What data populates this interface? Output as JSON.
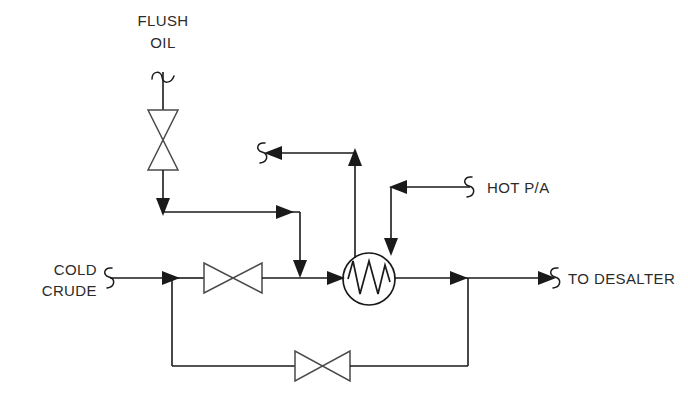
{
  "diagram": {
    "type": "process-flow-diagram",
    "background_color": "#ffffff",
    "line_color": "#1a1a1a",
    "valve_color": "#4a4a4a",
    "text_color": "#2b2b2b",
    "labels": {
      "flush_oil_line1": "FLUSH",
      "flush_oil_line2": "OIL",
      "cold_crude_line1": "COLD",
      "cold_crude_line2": "CRUDE",
      "hot_pa": "HOT P/A",
      "to_desalter": "TO DESALTER"
    },
    "equipment": [
      {
        "name": "heat-exchanger",
        "symbol": "circle-with-zigzag-coil",
        "cx": 369,
        "cy": 279,
        "r": 26
      },
      {
        "name": "flush-oil-valve",
        "symbol": "bowtie-gate-valve",
        "orientation": "vertical",
        "cx": 163,
        "cy": 140
      },
      {
        "name": "cold-crude-valve",
        "symbol": "bowtie-gate-valve",
        "orientation": "horizontal",
        "cx": 233,
        "cy": 278
      },
      {
        "name": "bypass-valve",
        "symbol": "bowtie-gate-valve",
        "orientation": "horizontal",
        "cx": 322,
        "cy": 366
      }
    ],
    "streams": [
      {
        "name": "flush-oil-inlet",
        "from": "FLUSH OIL",
        "to": "cold crude header",
        "break_symbol": true
      },
      {
        "name": "cold-crude-inlet",
        "from": "COLD CRUDE",
        "to": "exchanger",
        "break_symbol": true
      },
      {
        "name": "hot-pa-inlet",
        "from": "HOT P/A",
        "to": "exchanger",
        "break_symbol": true
      },
      {
        "name": "hot-pa-outlet",
        "from": "exchanger",
        "to": "off-page",
        "break_symbol": true
      },
      {
        "name": "crude-outlet",
        "from": "exchanger",
        "to": "TO DESALTER",
        "break_symbol": true
      },
      {
        "name": "exchanger-bypass",
        "from": "cold crude header",
        "to": "crude outlet header",
        "break_symbol": false
      }
    ]
  }
}
